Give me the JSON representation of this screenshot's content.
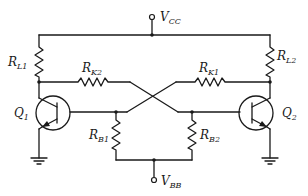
{
  "diagram": {
    "type": "circuit-schematic",
    "supplies": {
      "vcc": {
        "main": "V",
        "sub": "CC"
      },
      "vbb": {
        "main": "V",
        "sub": "BB"
      }
    },
    "resistors": {
      "rl1": {
        "main": "R",
        "sub": "L1"
      },
      "rl2": {
        "main": "R",
        "sub": "L2"
      },
      "rk1": {
        "main": "R",
        "sub": "K1"
      },
      "rk2": {
        "main": "R",
        "sub": "K2"
      },
      "rb1": {
        "main": "R",
        "sub": "B1"
      },
      "rb2": {
        "main": "R",
        "sub": "B2"
      }
    },
    "transistors": {
      "q1": {
        "main": "Q",
        "sub": "1",
        "kind": "NPN"
      },
      "q2": {
        "main": "Q",
        "sub": "2",
        "kind": "NPN"
      }
    },
    "colors": {
      "ink": "#1a1a1a",
      "background": "#ffffff"
    }
  }
}
